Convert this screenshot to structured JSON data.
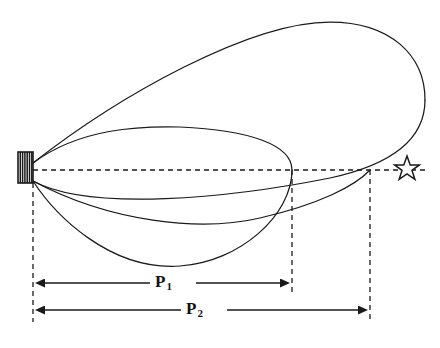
{
  "figure": {
    "type": "technical-trajectory-diagram",
    "background_color": "#ffffff",
    "stroke_color": "#1a1a1a",
    "width": 440,
    "height": 348
  },
  "labels": {
    "p1": {
      "base": "P",
      "subscript": "1",
      "full": "P1",
      "x": 155,
      "y": 272
    },
    "p2": {
      "base": "P",
      "subscript": "2",
      "full": "P2",
      "x": 186,
      "y": 299
    }
  },
  "markers": {
    "origin_block": {
      "name": "hatched-origin-block",
      "x": 18,
      "y": 152,
      "width": 15,
      "height": 31,
      "hatch_lines": 6
    },
    "target_star": {
      "name": "five-pointed-star",
      "center_x": 407,
      "center_y": 169,
      "outer_radius": 13,
      "inner_radius": 5.4,
      "points": 5
    }
  },
  "reference_lines": {
    "horizontal_axis": {
      "x1": 33,
      "y1": 170,
      "x2": 425,
      "y2": 170,
      "style": "dashed"
    },
    "vertical_origin": {
      "x": 33,
      "y1": 183,
      "y2": 322,
      "style": "dashed"
    },
    "vertical_p1": {
      "x": 292,
      "y1": 170,
      "y2": 296,
      "style": "dashed"
    },
    "vertical_p2": {
      "x": 370,
      "y1": 170,
      "y2": 322,
      "style": "dashed"
    }
  },
  "dimension_lines": {
    "p1_dimension": {
      "y": 283,
      "x_start": 33,
      "x_end": 292,
      "arrows": "both"
    },
    "p2_dimension": {
      "y": 310,
      "x_start": 33,
      "x_end": 370,
      "arrows": "both"
    }
  },
  "curves": {
    "outer_loop_upper": {
      "description": "large outer loop rising from origin to apex and sweeping right",
      "path": "M 33,163 C 120,95 250,22 330,22 C 390,22 425,55 425,100"
    },
    "outer_loop_lower": {
      "description": "large outer loop returning from far right down through axis to origin",
      "path": "M 425,100 C 425,140 390,165 330,178 C 230,198 90,212 33,181"
    },
    "inner_loop_upper": {
      "description": "inner closed loop upper arc",
      "path": "M 33,163 C 80,128 140,126 180,127 C 250,130 292,145 292,170"
    },
    "inner_loop_lower": {
      "description": "inner closed loop lower arc",
      "path": "M 292,170 C 292,215 240,262 180,266 C 110,271 55,215 33,181"
    },
    "middle_curve": {
      "description": "intermediate flat curve from origin sweeping to the far right near the star",
      "path": "M 33,181 C 110,222 200,232 260,218 C 320,204 355,186 370,170"
    }
  }
}
